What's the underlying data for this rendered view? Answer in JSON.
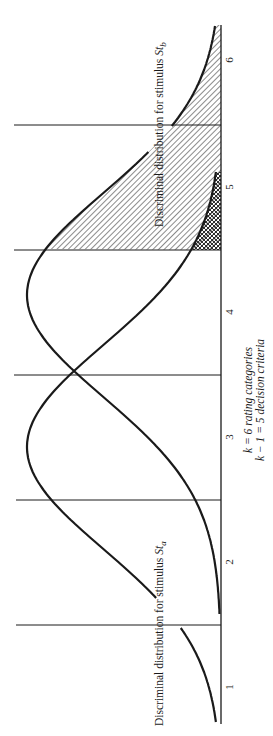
{
  "figure": {
    "orientation": "rotated-90-ccw",
    "ink_color": "#1a1a1a",
    "background": "#ffffff"
  },
  "axis": {
    "categories": [
      "1",
      "2",
      "3",
      "4",
      "5",
      "6"
    ],
    "annotation_line1": "k = 6 rating categories",
    "annotation_line2": "k − 1 = 5 decision criteria"
  },
  "labels": {
    "dist_a_prefix": "Discriminal distribution for stimulus ",
    "dist_a_symbol": "St",
    "dist_a_subscript": "a",
    "dist_b_prefix": "Discriminal distribution for stimulus ",
    "dist_b_symbol": "St",
    "dist_b_subscript": "b"
  },
  "chart_data": {
    "type": "area",
    "title": "",
    "xlabel": "k = 6 rating categories; k − 1 = 5 decision criteria",
    "ylabel": "",
    "categories": [
      "1",
      "2",
      "3",
      "4",
      "5",
      "6"
    ],
    "criteria_positions": [
      1.5,
      2.5,
      3.5,
      4.5,
      5.5
    ],
    "series": [
      {
        "name": "Discriminal distribution for stimulus St_a",
        "mean": 2.8,
        "sd": 0.84,
        "shaded_region": [
          4.5,
          5.2
        ],
        "shading": "cross-hatch"
      },
      {
        "name": "Discriminal distribution for stimulus St_b",
        "mean": 4.0,
        "sd": 0.84,
        "shaded_region": [
          4.5,
          6.3
        ],
        "shading": "diagonal-hatch"
      }
    ],
    "xlim": [
      0.7,
      6.3
    ],
    "grid": false,
    "legend": "none (labels placed along curves)"
  }
}
